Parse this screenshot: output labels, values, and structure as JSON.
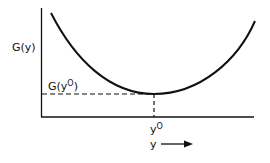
{
  "diagram": {
    "type": "line",
    "title": "",
    "ylabel": "G(y)",
    "xlabel": "y",
    "x_direction_arrow": true,
    "min_label_y": {
      "base": "G(y",
      "sup": "O",
      "close": ")"
    },
    "min_label_x": {
      "base": "y",
      "sup": "O"
    },
    "curve": "convex U-shaped curve with minimum G(y°) at y = y°",
    "colors": {
      "line": "#111111",
      "background": "#ffffff"
    }
  }
}
